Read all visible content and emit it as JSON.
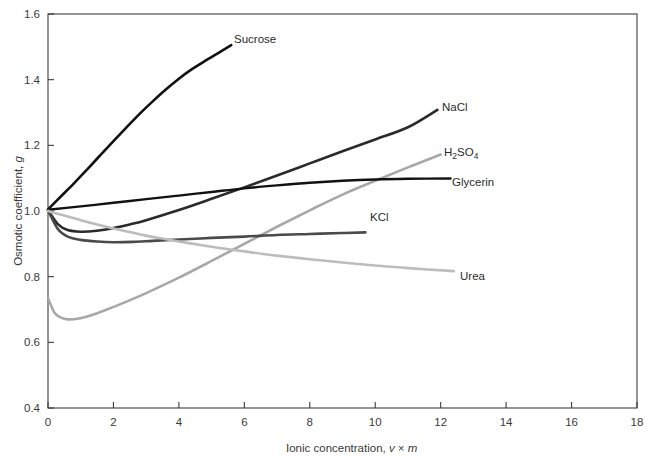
{
  "chart_data": {
    "type": "line",
    "title": "",
    "xlabel": "Ionic concentration, v × m",
    "xlabel_parts": {
      "prefix": "Ionic concentration, ",
      "sym1": "v",
      "mid": " × ",
      "sym2": "m"
    },
    "ylabel": "Osmotic coefficient, g",
    "ylabel_parts": {
      "prefix": "Osmotic coefficient, ",
      "sym": "g"
    },
    "xlim": [
      0,
      18
    ],
    "ylim": [
      0.4,
      1.6
    ],
    "xticks": [
      0,
      2,
      4,
      6,
      8,
      10,
      12,
      14,
      16,
      18
    ],
    "xtick_labels": [
      "0",
      "2",
      "4",
      "6",
      "8",
      "10",
      "12",
      "14",
      "16",
      "18"
    ],
    "yticks": [
      0.4,
      0.6,
      0.8,
      1.0,
      1.2,
      1.4,
      1.6
    ],
    "ytick_labels": [
      "0.4",
      "0.6",
      "0.8",
      "1.0",
      "1.2",
      "1.4",
      "1.6"
    ],
    "grid": false,
    "legend_position": "inline-end-labels",
    "series": [
      {
        "name": "Sucrose",
        "label": "Sucrose",
        "color": "#111111",
        "width": 2.6,
        "label_x": 234,
        "label_y": 43,
        "points": [
          [
            0.0,
            1.005
          ],
          [
            0.4,
            1.045
          ],
          [
            0.8,
            1.085
          ],
          [
            1.2,
            1.127
          ],
          [
            1.6,
            1.17
          ],
          [
            2.0,
            1.213
          ],
          [
            2.4,
            1.255
          ],
          [
            2.8,
            1.296
          ],
          [
            3.2,
            1.334
          ],
          [
            3.6,
            1.37
          ],
          [
            4.0,
            1.403
          ],
          [
            4.4,
            1.432
          ],
          [
            4.8,
            1.457
          ],
          [
            5.2,
            1.481
          ],
          [
            5.6,
            1.505
          ]
        ]
      },
      {
        "name": "NaCl",
        "label": "NaCl",
        "color": "#2a2a2a",
        "width": 2.6,
        "label_x": 442,
        "label_y": 111,
        "points": [
          [
            0.0,
            1.003
          ],
          [
            0.3,
            0.96
          ],
          [
            0.6,
            0.942
          ],
          [
            1.0,
            0.937
          ],
          [
            1.5,
            0.94
          ],
          [
            2.0,
            0.948
          ],
          [
            2.5,
            0.959
          ],
          [
            3.0,
            0.972
          ],
          [
            4.0,
            1.003
          ],
          [
            5.0,
            1.037
          ],
          [
            6.0,
            1.072
          ],
          [
            7.0,
            1.108
          ],
          [
            8.0,
            1.145
          ],
          [
            9.0,
            1.182
          ],
          [
            10.0,
            1.218
          ],
          [
            11.0,
            1.255
          ],
          [
            11.9,
            1.308
          ]
        ]
      },
      {
        "name": "H2SO4",
        "label": "H2SO4",
        "label_main": "H",
        "label_sub1": "2",
        "label_mid": "SO",
        "label_sub2": "4",
        "color": "#a8a8a8",
        "width": 2.6,
        "label_x": 444,
        "label_y": 156,
        "points": [
          [
            0.0,
            0.735
          ],
          [
            0.2,
            0.69
          ],
          [
            0.4,
            0.675
          ],
          [
            0.6,
            0.67
          ],
          [
            0.9,
            0.672
          ],
          [
            1.3,
            0.682
          ],
          [
            1.8,
            0.7
          ],
          [
            2.4,
            0.724
          ],
          [
            3.0,
            0.75
          ],
          [
            4.0,
            0.797
          ],
          [
            5.0,
            0.848
          ],
          [
            6.0,
            0.9
          ],
          [
            7.0,
            0.952
          ],
          [
            8.0,
            1.002
          ],
          [
            9.0,
            1.05
          ],
          [
            10.0,
            1.092
          ],
          [
            11.0,
            1.133
          ],
          [
            12.0,
            1.172
          ]
        ]
      },
      {
        "name": "Glycerin",
        "label": "Glycerin",
        "color": "#111111",
        "width": 2.4,
        "label_x": 452,
        "label_y": 186,
        "points": [
          [
            0.0,
            1.004
          ],
          [
            1.0,
            1.014
          ],
          [
            2.0,
            1.025
          ],
          [
            3.0,
            1.036
          ],
          [
            4.0,
            1.047
          ],
          [
            5.0,
            1.058
          ],
          [
            6.0,
            1.069
          ],
          [
            7.0,
            1.078
          ],
          [
            8.0,
            1.086
          ],
          [
            9.0,
            1.092
          ],
          [
            10.0,
            1.096
          ],
          [
            11.0,
            1.098
          ],
          [
            12.3,
            1.099
          ]
        ]
      },
      {
        "name": "KCl",
        "label": "KCl",
        "color": "#4a4a4a",
        "width": 2.6,
        "label_x": 370,
        "label_y": 221,
        "points": [
          [
            0.0,
            1.002
          ],
          [
            0.3,
            0.945
          ],
          [
            0.6,
            0.922
          ],
          [
            1.0,
            0.912
          ],
          [
            1.5,
            0.907
          ],
          [
            2.0,
            0.905
          ],
          [
            2.6,
            0.906
          ],
          [
            3.2,
            0.909
          ],
          [
            4.0,
            0.913
          ],
          [
            5.0,
            0.918
          ],
          [
            6.0,
            0.922
          ],
          [
            7.0,
            0.927
          ],
          [
            8.0,
            0.93
          ],
          [
            9.0,
            0.933
          ],
          [
            9.7,
            0.935
          ]
        ]
      },
      {
        "name": "Urea",
        "label": "Urea",
        "color": "#bcbcbc",
        "width": 2.6,
        "label_x": 460,
        "label_y": 280,
        "points": [
          [
            0.0,
            1.0
          ],
          [
            0.5,
            0.986
          ],
          [
            1.0,
            0.972
          ],
          [
            1.5,
            0.959
          ],
          [
            2.0,
            0.947
          ],
          [
            2.5,
            0.936
          ],
          [
            3.0,
            0.925
          ],
          [
            3.5,
            0.916
          ],
          [
            4.0,
            0.907
          ],
          [
            5.0,
            0.891
          ],
          [
            6.0,
            0.877
          ],
          [
            7.0,
            0.864
          ],
          [
            8.0,
            0.853
          ],
          [
            9.0,
            0.843
          ],
          [
            10.0,
            0.834
          ],
          [
            11.0,
            0.826
          ],
          [
            12.4,
            0.817
          ]
        ]
      }
    ]
  }
}
